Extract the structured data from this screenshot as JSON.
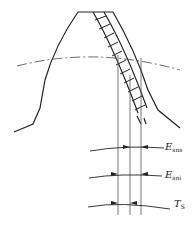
{
  "diagram": {
    "labels": [
      {
        "id": "esns",
        "main": "E",
        "sub": "sns",
        "x": 165,
        "y": 146
      },
      {
        "id": "esni",
        "main": "E",
        "sub": "sni",
        "x": 165,
        "y": 172
      },
      {
        "id": "ts",
        "main": "T",
        "sub": "S",
        "x": 174,
        "y": 201
      }
    ],
    "elements": [
      "tooth-profile",
      "tolerance-hatch-band",
      "pitch-circle",
      "reference-lines",
      "dimension-arcs"
    ]
  }
}
